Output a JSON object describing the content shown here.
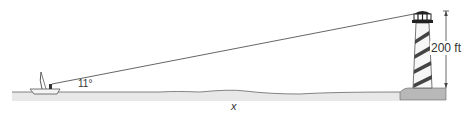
{
  "diagram": {
    "type": "right-triangle word problem illustration",
    "labels": {
      "angle": "11°",
      "height": "200 ft",
      "distance": "x"
    },
    "objects": {
      "observer": "sailboat",
      "landmark": "lighthouse"
    },
    "colors": {
      "line": "#555555",
      "water": "#e6e6e6",
      "ground": "#b5b5b5",
      "stripe": "#444444",
      "lamp": "#222222"
    }
  }
}
